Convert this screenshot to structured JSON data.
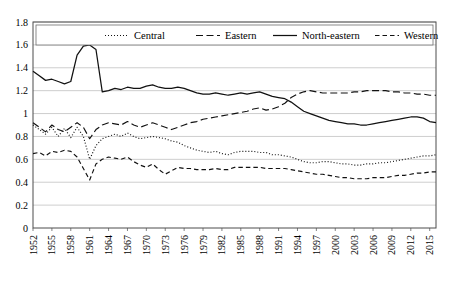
{
  "chart_data": {
    "type": "line",
    "title": "",
    "subtitle": "",
    "xlabel": "",
    "ylabel": "",
    "ylim": [
      0,
      1.8
    ],
    "ytick_labels": [
      "0",
      "0.2",
      "0.4",
      "0.6",
      "0.8",
      "1",
      "1.2",
      "1.4",
      "1.6",
      "1.8"
    ],
    "ytick_values": [
      0,
      0.2,
      0.4,
      0.6,
      0.8,
      1.0,
      1.2,
      1.4,
      1.6,
      1.8
    ],
    "grid": "horizontal",
    "legend_position": "top-inside",
    "x": [
      1952,
      1953,
      1954,
      1955,
      1956,
      1957,
      1958,
      1959,
      1960,
      1961,
      1962,
      1963,
      1964,
      1965,
      1966,
      1967,
      1968,
      1969,
      1970,
      1971,
      1972,
      1973,
      1974,
      1975,
      1976,
      1977,
      1978,
      1979,
      1980,
      1981,
      1982,
      1983,
      1984,
      1985,
      1986,
      1987,
      1988,
      1989,
      1990,
      1991,
      1992,
      1993,
      1994,
      1995,
      1996,
      1997,
      1998,
      1999,
      2000,
      2001,
      2002,
      2003,
      2004,
      2005,
      2006,
      2007,
      2008,
      2009,
      2010,
      2011,
      2012,
      2013,
      2014,
      2015,
      2016
    ],
    "xtick_labels": [
      "1952",
      "1955",
      "1958",
      "1961",
      "1964",
      "1967",
      "1970",
      "1973",
      "1976",
      "1979",
      "1982",
      "1985",
      "1988",
      "1991",
      "1994",
      "1997",
      "2000",
      "2003",
      "2006",
      "2009",
      "2012",
      "2015"
    ],
    "series": [
      {
        "name": "Central",
        "style": "dotted",
        "values": [
          0.9,
          0.86,
          0.82,
          0.88,
          0.8,
          0.87,
          0.79,
          0.88,
          0.8,
          0.6,
          0.72,
          0.78,
          0.8,
          0.82,
          0.8,
          0.83,
          0.8,
          0.78,
          0.79,
          0.8,
          0.79,
          0.78,
          0.76,
          0.75,
          0.72,
          0.7,
          0.68,
          0.67,
          0.66,
          0.67,
          0.65,
          0.64,
          0.66,
          0.67,
          0.67,
          0.67,
          0.66,
          0.66,
          0.64,
          0.64,
          0.63,
          0.62,
          0.6,
          0.58,
          0.57,
          0.57,
          0.58,
          0.58,
          0.57,
          0.56,
          0.56,
          0.55,
          0.55,
          0.56,
          0.56,
          0.57,
          0.57,
          0.58,
          0.59,
          0.6,
          0.61,
          0.62,
          0.63,
          0.63,
          0.64
        ]
      },
      {
        "name": "Eastern",
        "style": "dashed-long",
        "values": [
          0.92,
          0.88,
          0.84,
          0.9,
          0.86,
          0.84,
          0.88,
          0.92,
          0.88,
          0.78,
          0.86,
          0.9,
          0.92,
          0.91,
          0.9,
          0.93,
          0.9,
          0.88,
          0.9,
          0.92,
          0.9,
          0.88,
          0.86,
          0.88,
          0.9,
          0.92,
          0.93,
          0.95,
          0.96,
          0.97,
          0.98,
          0.99,
          1.0,
          1.01,
          1.02,
          1.04,
          1.05,
          1.03,
          1.04,
          1.06,
          1.09,
          1.14,
          1.17,
          1.19,
          1.2,
          1.19,
          1.18,
          1.18,
          1.18,
          1.18,
          1.18,
          1.19,
          1.19,
          1.2,
          1.2,
          1.2,
          1.2,
          1.19,
          1.19,
          1.18,
          1.18,
          1.17,
          1.17,
          1.16,
          1.16
        ]
      },
      {
        "name": "North-eastern",
        "style": "solid",
        "values": [
          1.37,
          1.33,
          1.29,
          1.3,
          1.28,
          1.26,
          1.28,
          1.51,
          1.59,
          1.6,
          1.56,
          1.19,
          1.2,
          1.22,
          1.21,
          1.23,
          1.22,
          1.22,
          1.24,
          1.25,
          1.23,
          1.22,
          1.22,
          1.23,
          1.22,
          1.2,
          1.18,
          1.17,
          1.17,
          1.18,
          1.17,
          1.16,
          1.17,
          1.18,
          1.17,
          1.18,
          1.19,
          1.17,
          1.15,
          1.14,
          1.13,
          1.1,
          1.06,
          1.02,
          1.0,
          0.98,
          0.96,
          0.94,
          0.93,
          0.92,
          0.91,
          0.91,
          0.9,
          0.9,
          0.91,
          0.92,
          0.93,
          0.94,
          0.95,
          0.96,
          0.97,
          0.97,
          0.96,
          0.93,
          0.92
        ]
      },
      {
        "name": "Western",
        "style": "dashed-short",
        "values": [
          0.65,
          0.66,
          0.63,
          0.67,
          0.66,
          0.68,
          0.67,
          0.62,
          0.52,
          0.42,
          0.56,
          0.6,
          0.62,
          0.61,
          0.6,
          0.62,
          0.58,
          0.55,
          0.53,
          0.56,
          0.51,
          0.47,
          0.5,
          0.53,
          0.52,
          0.52,
          0.51,
          0.51,
          0.51,
          0.52,
          0.51,
          0.51,
          0.53,
          0.53,
          0.53,
          0.53,
          0.53,
          0.52,
          0.52,
          0.52,
          0.52,
          0.51,
          0.5,
          0.49,
          0.48,
          0.47,
          0.47,
          0.46,
          0.45,
          0.44,
          0.44,
          0.43,
          0.43,
          0.43,
          0.44,
          0.44,
          0.44,
          0.45,
          0.46,
          0.46,
          0.47,
          0.48,
          0.48,
          0.49,
          0.49
        ]
      }
    ]
  },
  "legend": {
    "items": [
      {
        "label": "Central",
        "marker": "dotted-line-icon"
      },
      {
        "label": "Eastern",
        "marker": "dashed-line-icon"
      },
      {
        "label": "North-eastern",
        "marker": "solid-line-icon"
      },
      {
        "label": "Western",
        "marker": "dashed-line-icon"
      }
    ]
  }
}
